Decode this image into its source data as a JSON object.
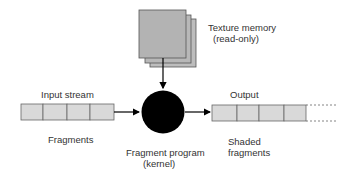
{
  "diagram": {
    "texture_memory": {
      "label_line1": "Texture memory",
      "label_line2": "(read-only)"
    },
    "input_stream": {
      "title": "Input stream",
      "caption": "Fragments",
      "cells": 4
    },
    "kernel": {
      "label_line1": "Fragment program",
      "label_line2": "(kernel)"
    },
    "output": {
      "title": "Output",
      "caption_line1": "Shaded",
      "caption_line2": "fragments",
      "cells": 4
    },
    "colors": {
      "cell_fill": "#d9d9d9",
      "cell_stroke": "#666666",
      "texture_fill": "#b3b3b3",
      "kernel_fill": "#000000",
      "arrow": "#000000"
    }
  }
}
